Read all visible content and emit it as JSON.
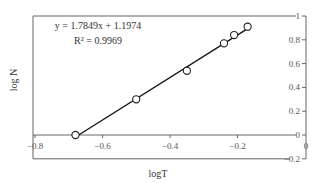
{
  "chart_data": {
    "type": "scatter",
    "title": "",
    "xlabel": "logT",
    "ylabel": "log N",
    "xlim": [
      -0.8,
      0
    ],
    "ylim": [
      -0.2,
      1
    ],
    "x_ticks": [
      "-0.8",
      "-0.6",
      "-0.4",
      "-0.2",
      "0"
    ],
    "y_ticks": [
      "-0.2",
      "0",
      "0.2",
      "0.4",
      "0.6",
      "0.8",
      "1"
    ],
    "grid": false,
    "series": [
      {
        "name": "log N vs log T",
        "marker": "open-circle",
        "x": [
          -0.68,
          -0.5,
          -0.35,
          -0.24,
          -0.21,
          -0.17
        ],
        "y": [
          0.0,
          0.3,
          0.54,
          0.77,
          0.84,
          0.91
        ]
      }
    ],
    "fit_line": {
      "slope": 1.7849,
      "intercept": 1.1974,
      "x_range": [
        -0.68,
        -0.17
      ]
    },
    "annotations": [
      "y = 1.7849x + 1.1974",
      "R² = 0.9969"
    ]
  },
  "labels": {
    "equation": "y = 1.7849x + 1.1974",
    "r_squared": "R² = 0.9969",
    "xlabel": "logT",
    "ylabel": "log N"
  }
}
